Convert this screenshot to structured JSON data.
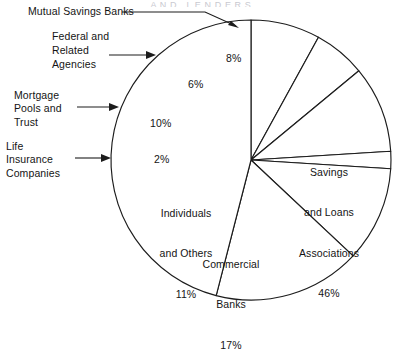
{
  "figure": {
    "title_clipped": "A N D   L E N D E R S",
    "background_color": "#ffffff",
    "line_color": "#1c1c1c"
  },
  "chart_data": {
    "type": "pie",
    "title": "",
    "xlabel": "",
    "ylabel": "",
    "grid": false,
    "legend_position": "callouts-and-inline",
    "units": "percent",
    "start_angle_deg": 90,
    "direction": "counterclockwise",
    "total": 100,
    "categories": [
      "Mutual Savings Banks",
      "Federal and Related Agencies",
      "Mortgage Pools and Trust",
      "Life Insurance Companies",
      "Individuals and Others",
      "Commercial Banks",
      "Savings and Loans Associations"
    ],
    "values": [
      8,
      6,
      10,
      2,
      11,
      17,
      46
    ],
    "slices": [
      {
        "name": "Mutual Savings Banks",
        "value": 8,
        "value_label": "8%",
        "label_placement": "callout",
        "callout_text": "Mutual Savings Banks",
        "inline_text": "8%"
      },
      {
        "name": "Federal and Related Agencies",
        "value": 6,
        "value_label": "6%",
        "label_placement": "callout",
        "callout_text": "Federal and\nRelated\nAgencies",
        "inline_text": "6%"
      },
      {
        "name": "Mortgage Pools and Trust",
        "value": 10,
        "value_label": "10%",
        "label_placement": "callout",
        "callout_text": "Mortgage\nPools and\nTrust",
        "inline_text": "10%"
      },
      {
        "name": "Life Insurance Companies",
        "value": 2,
        "value_label": "2%",
        "label_placement": "callout",
        "callout_text": "Life\nInsurance\nCompanies",
        "inline_text": "2%"
      },
      {
        "name": "Individuals and Others",
        "value": 11,
        "value_label": "11%",
        "label_placement": "inline",
        "callout_text": "",
        "inline_text": "Individuals\nand Others\n11%"
      },
      {
        "name": "Commercial Banks",
        "value": 17,
        "value_label": "17%",
        "label_placement": "inline",
        "callout_text": "",
        "inline_text": "Commercial\nBanks\n17%"
      },
      {
        "name": "Savings and Loans Associations",
        "value": 46,
        "value_label": "46%",
        "label_placement": "inline",
        "callout_text": "",
        "inline_text": "Savings\nand Loans\nAssociations\n46%"
      }
    ]
  },
  "callouts": {
    "mutual_savings_banks": "Mutual Savings Banks",
    "federal_line1": "Federal and",
    "federal_line2": "Related",
    "federal_line3": "Agencies",
    "mortgage_line1": "Mortgage",
    "mortgage_line2": "Pools and",
    "mortgage_line3": "Trust",
    "life_line1": "Life",
    "life_line2": "Insurance",
    "life_line3": "Companies"
  },
  "inline_labels": {
    "pct_8": "8%",
    "pct_6": "6%",
    "pct_10": "10%",
    "pct_2": "2%",
    "individuals_line1": "Individuals",
    "individuals_line2": "and Others",
    "individuals_pct": "11%",
    "commercial_line1": "Commercial",
    "commercial_line2": "Banks",
    "commercial_pct": "17%",
    "savings_line1": "Savings",
    "savings_line2": "and Loans",
    "savings_line3": "Associations",
    "savings_pct": "46%"
  }
}
